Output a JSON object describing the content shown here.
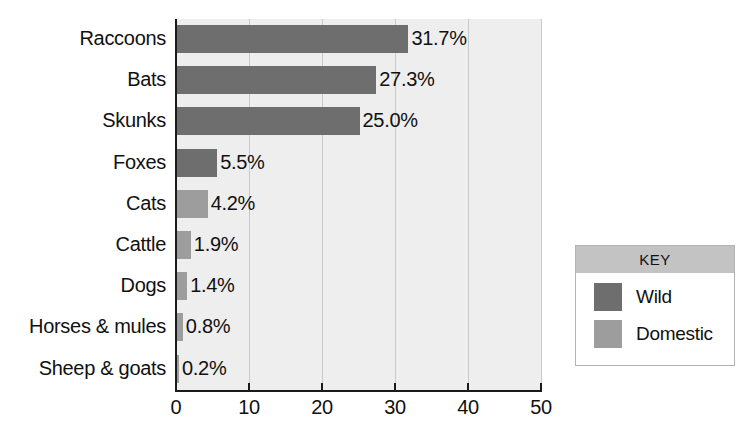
{
  "chart_data": {
    "type": "bar",
    "orientation": "horizontal",
    "title": "",
    "xlabel": "",
    "ylabel": "",
    "xlim": [
      0,
      50
    ],
    "xticks": [
      0,
      10,
      20,
      30,
      40,
      50
    ],
    "xticklabels": [
      "0",
      "10",
      "20",
      "30",
      "40",
      "50"
    ],
    "grid": true,
    "grid_axis": "x",
    "legend_position": "right-outside",
    "categories": [
      "Raccoons",
      "Bats",
      "Skunks",
      "Foxes",
      "Cats",
      "Cattle",
      "Dogs",
      "Horses & mules",
      "Sheep & goats"
    ],
    "values": [
      31.7,
      27.3,
      25.0,
      5.5,
      4.2,
      1.9,
      1.4,
      0.8,
      0.2
    ],
    "data_labels": [
      "31.7%",
      "27.3%",
      "25.0%",
      "5.5%",
      "4.2%",
      "1.9%",
      "1.4%",
      "0.8%",
      "0.2%"
    ],
    "groups": [
      "Wild",
      "Wild",
      "Wild",
      "Wild",
      "Domestic",
      "Domestic",
      "Domestic",
      "Domestic",
      "Domestic"
    ],
    "series": [
      {
        "name": "Wild",
        "color": "#6e6e6e",
        "points": [
          {
            "category": "Raccoons",
            "value": 31.7,
            "label": "31.7%"
          },
          {
            "category": "Bats",
            "value": 27.3,
            "label": "27.3%"
          },
          {
            "category": "Skunks",
            "value": 25.0,
            "label": "25.0%"
          },
          {
            "category": "Foxes",
            "value": 5.5,
            "label": "5.5%"
          }
        ]
      },
      {
        "name": "Domestic",
        "color": "#9d9d9d",
        "points": [
          {
            "category": "Cats",
            "value": 4.2,
            "label": "4.2%"
          },
          {
            "category": "Cattle",
            "value": 1.9,
            "label": "1.9%"
          },
          {
            "category": "Dogs",
            "value": 1.4,
            "label": "1.4%"
          },
          {
            "category": "Horses & mules",
            "value": 0.8,
            "label": "0.8%"
          },
          {
            "category": "Sheep & goats",
            "value": 0.2,
            "label": "0.2%"
          }
        ]
      }
    ]
  },
  "legend": {
    "header": "KEY",
    "entries": [
      {
        "label": "Wild",
        "color": "#6e6e6e"
      },
      {
        "label": "Domestic",
        "color": "#9d9d9d"
      }
    ]
  },
  "colors": {
    "wild": "#6e6e6e",
    "domestic": "#9d9d9d",
    "plot_background": "#eeeeee",
    "axis": "#1a1a1a",
    "gridline": "#c9c9c9",
    "legend_header_bg": "#c3c3c3"
  }
}
